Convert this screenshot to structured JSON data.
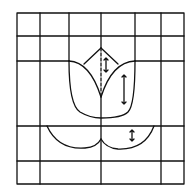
{
  "diagram": {
    "colors": {
      "line": "#111111",
      "background": "#ffffff"
    },
    "border": {
      "x": 17,
      "y": 13,
      "w": 167,
      "h": 171
    },
    "grid": {
      "full_verticals": [
        40,
        101,
        161
      ],
      "top_verticals": [
        69,
        135
      ],
      "horizontals": [
        36,
        61,
        126,
        161
      ]
    },
    "arrows": [
      {
        "name": "bud-arrow",
        "x": 106,
        "y1": 58,
        "y2": 72
      },
      {
        "name": "right-petal-arrow",
        "x": 124,
        "y1": 75,
        "y2": 104
      },
      {
        "name": "leaf-arrow",
        "x": 132,
        "y1": 130,
        "y2": 141
      }
    ]
  }
}
